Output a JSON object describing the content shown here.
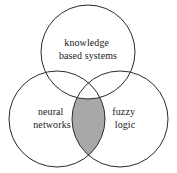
{
  "diagram": {
    "type": "venn",
    "title": "",
    "canvas": {
      "width": 177,
      "height": 173,
      "background": "#ffffff"
    },
    "style": {
      "stroke_color": "#2b2b2b",
      "stroke_width": 1,
      "circle_fill": "none",
      "intersection_fill": "#a8a8a8",
      "text_color": "#1a1a1a",
      "font_size_px": 10
    },
    "sets": [
      {
        "id": "knowledge-based-systems",
        "label_line1": "knowledge",
        "label_line2": "based systems",
        "cx": 88,
        "cy": 52,
        "r": 47,
        "label_x": 88,
        "label_y": 44
      },
      {
        "id": "neural-networks",
        "label_line1": "neural",
        "label_line2": "networks",
        "cx": 57,
        "cy": 119,
        "r": 48,
        "label_x": 52,
        "label_y": 113
      },
      {
        "id": "fuzzy-logic",
        "label_line1": "fuzzy",
        "label_line2": "logic",
        "cx": 120,
        "cy": 119,
        "r": 48,
        "label_x": 125,
        "label_y": 113
      }
    ],
    "intersections": [
      {
        "id": "neural-networks-and-fuzzy-logic",
        "between": [
          "neural-networks",
          "fuzzy-logic"
        ],
        "shaded": true,
        "fill": "#a8a8a8",
        "label": ""
      }
    ]
  }
}
